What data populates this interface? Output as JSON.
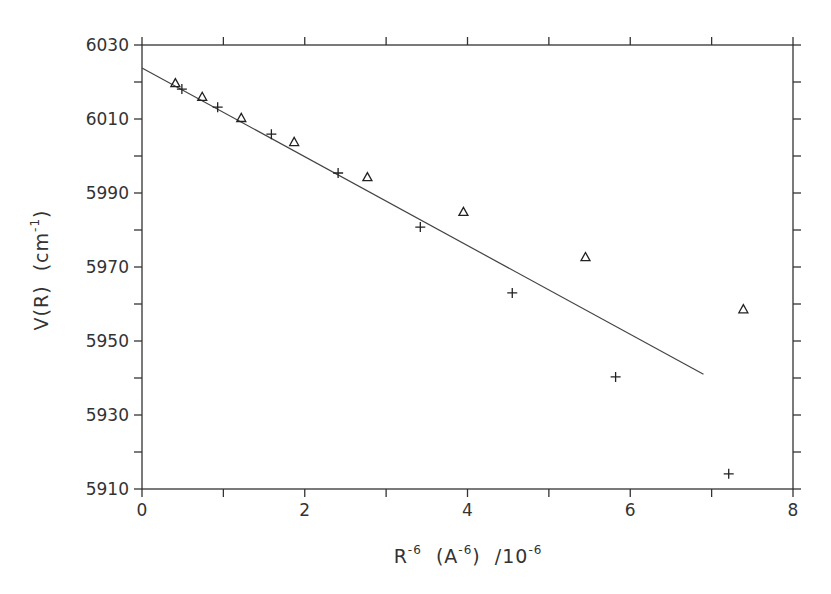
{
  "chart_data": {
    "type": "scatter",
    "title": "",
    "xlabel": "R^-6 (A^-6) /10^-6",
    "ylabel": "V(R) (cm^-1)",
    "xlabel_parts": {
      "base": "R",
      "exp1": "-6",
      "mid": "  (A",
      "exp2": "-6",
      "close": ")  /10",
      "exp3": "-6"
    },
    "ylabel_parts": {
      "base": "V(R)  (cm",
      "exp": "-1",
      "close": ")"
    },
    "xlim": [
      0,
      8
    ],
    "ylim": [
      5910,
      6030
    ],
    "x_ticks_major": [
      0,
      2,
      4,
      6,
      8
    ],
    "x_tick_labels": [
      "0",
      "2",
      "4",
      "6",
      "8"
    ],
    "x_ticks_minor": [
      1,
      3,
      5,
      7
    ],
    "y_ticks_major": [
      5910,
      5930,
      5950,
      5970,
      5990,
      6010,
      6030
    ],
    "y_tick_labels": [
      "5910",
      "5930",
      "5950",
      "5970",
      "5990",
      "6010",
      "6030"
    ],
    "y_ticks_minor": [
      5920,
      5940,
      5960,
      5980,
      6000,
      6020
    ],
    "grid": false,
    "legend": null,
    "series": [
      {
        "name": "triangles",
        "marker": "triangle",
        "x": [
          0.41,
          0.74,
          1.22,
          1.87,
          2.77,
          3.95,
          5.45,
          7.39
        ],
        "y": [
          6019.7,
          6016.0,
          6010.3,
          6003.8,
          5994.3,
          5984.9,
          5972.7,
          5958.6
        ]
      },
      {
        "name": "plus",
        "marker": "plus",
        "x": [
          0.49,
          0.93,
          1.59,
          2.41,
          3.42,
          4.55,
          5.82,
          7.21
        ],
        "y": [
          6018.1,
          6013.2,
          6005.9,
          5995.4,
          5980.8,
          5963.0,
          5940.3,
          5914.1
        ]
      },
      {
        "name": "linear fit",
        "marker": "line",
        "x": [
          0.0,
          6.9
        ],
        "y": [
          6023.8,
          5941.0
        ]
      }
    ]
  }
}
